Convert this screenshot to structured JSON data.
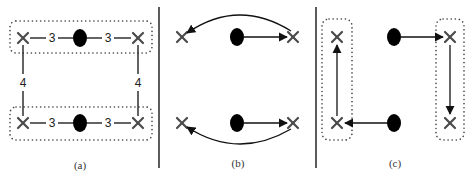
{
  "figure": {
    "panels": [
      {
        "id": "a",
        "caption": "(a)",
        "top_row": {
          "left_weight": "3",
          "right_weight": "3"
        },
        "bottom_row": {
          "left_weight": "3",
          "right_weight": "3"
        },
        "left_vertical_weight": "4",
        "right_vertical_weight": "4"
      },
      {
        "id": "b",
        "caption": "(b)"
      },
      {
        "id": "c",
        "caption": "(c)"
      }
    ],
    "colors": {
      "stroke": "#222222",
      "node_fill": "#000000",
      "background": "#ffffff"
    }
  }
}
